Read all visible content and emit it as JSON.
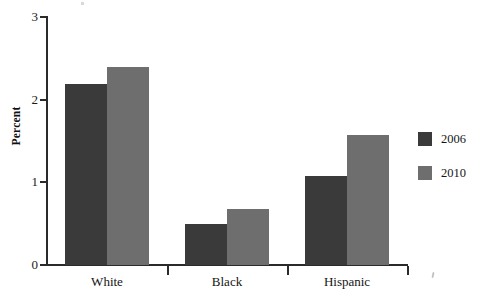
{
  "chart_data": {
    "type": "bar",
    "title": "",
    "subtitle": "",
    "xlabel": "",
    "ylabel": "Percent",
    "categories": [
      "White",
      "Black",
      "Hispanic"
    ],
    "series": [
      {
        "name": "2006",
        "color": "#3a3a3a",
        "values": [
          2.19,
          0.5,
          1.08
        ]
      },
      {
        "name": "2010",
        "color": "#6e6e6e",
        "values": [
          2.39,
          0.68,
          1.57
        ]
      }
    ],
    "ylim": [
      0,
      3
    ],
    "yticks": [
      0,
      1,
      2,
      3
    ],
    "ytick_labels": [
      "0",
      "1",
      "2",
      "3"
    ],
    "grid": false,
    "legend_position": "right",
    "legend_entries": [
      {
        "label": "2006",
        "color": "#3a3a3a"
      },
      {
        "label": "2010",
        "color": "#6e6e6e"
      }
    ]
  },
  "axes": {
    "y_title": "Percent",
    "y_tick_labels": [
      "3",
      "2",
      "1",
      "0"
    ],
    "x_tick_labels": [
      "White",
      "Black",
      "Hispanic"
    ]
  },
  "legend": {
    "items": [
      {
        "label": "2006"
      },
      {
        "label": "2010"
      }
    ]
  },
  "colors": {
    "series_2006": "#3a3a3a",
    "series_2010": "#6e6e6e",
    "axis": "#2b2b2b",
    "text": "#151515",
    "background": "#ffffff"
  }
}
